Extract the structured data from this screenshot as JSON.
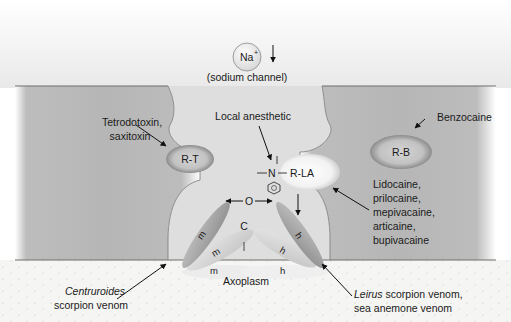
{
  "diagram": {
    "ion": {
      "symbol": "Na",
      "charge": "+",
      "caption": "(sodium channel)",
      "direction_arrow": "down-arrow"
    },
    "receptors": {
      "tetrodotoxin": "R-T",
      "local_anesthetic": "R-LA",
      "benzocaine": "R-B"
    },
    "labels": {
      "tetrodotoxin_line1": "Tetrodotoxin,",
      "tetrodotoxin_line2": "saxitoxin",
      "local_anesthetic": "Local anesthetic",
      "benzocaine": "Benzocaine",
      "lidocaine_group": [
        "Lidocaine,",
        "prilocaine,",
        "mepivacaine,",
        "articaine,",
        "bupivacaine"
      ],
      "axoplasm": "Axoplasm",
      "centruroides_line1": "Centruroides",
      "centruroides_line2": "scorpion venom",
      "leirus_line1_italic": "Leirus",
      "leirus_line1_rest": " scorpion venom,",
      "leirus_line2": "sea anemone venom"
    },
    "molecule": {
      "nitrogen": "N",
      "bond_left": "—",
      "bond_right": "—",
      "ring": "benzene-ring-icon"
    },
    "gate_states": {
      "open": "O",
      "closed": "C",
      "inactivated": "I"
    },
    "m_gates": [
      "m",
      "m",
      "m"
    ],
    "h_gates": [
      "h",
      "h",
      "h"
    ],
    "colors": {
      "membrane": "#b9b9b9",
      "membrane_edge": "#6e6e6e",
      "extracellular": "#f2f2f2",
      "pore": "#dcdcdc",
      "axoplasm": "#f4f4f1",
      "receptor_fill": "#c8c8c8",
      "receptor_rim": "#8a8a8a",
      "gate_dark": "#9b9b9b",
      "gate_light": "#d0d0d0",
      "text": "#1a1a1a"
    }
  }
}
